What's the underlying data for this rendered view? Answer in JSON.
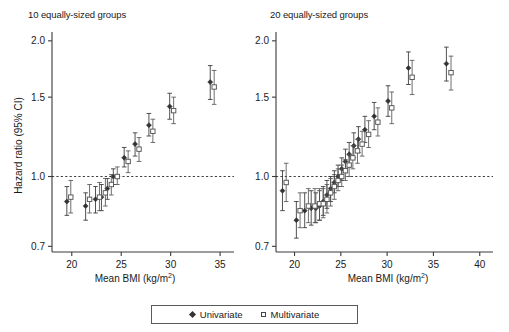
{
  "figure": {
    "legend": {
      "univariate_label": "Univariate",
      "multivariate_label": "Multivariate"
    },
    "axis": {
      "ylabel": "Hazard ratio (95% CI)",
      "xlabel_main": "Mean BMI (kg/m",
      "xlabel_unit": "2",
      "xlabel_close": ")"
    }
  },
  "chart_data": [
    {
      "type": "scatter",
      "panel": "left",
      "title": "10 equally-sized groups",
      "xlabel": "Mean BMI (kg/m2)",
      "ylabel": "Hazard ratio (95% CI)",
      "yscale": "log",
      "ylim": [
        0.68,
        2.05
      ],
      "yticks": [
        0.7,
        1.0,
        1.5,
        2.0
      ],
      "ytick_labels": [
        "0.7",
        "1.0",
        "1.5",
        "2.0"
      ],
      "xlim": [
        18.0,
        36.0
      ],
      "xticks": [
        20,
        25,
        30,
        35
      ],
      "xtick_labels": [
        "20",
        "25",
        "30",
        "35"
      ],
      "grid": false,
      "reference_line": 1.0,
      "legend_position": "bottom-center",
      "series": [
        {
          "name": "Univariate",
          "marker": "filled-diamond",
          "color": "#333333",
          "x": [
            19.5,
            21.4,
            22.4,
            23.0,
            23.6,
            24.2,
            25.3,
            26.4,
            27.8,
            29.9
          ],
          "y": [
            0.88,
            0.86,
            0.89,
            0.9,
            0.94,
            1.0,
            1.1,
            1.18,
            1.3,
            1.43
          ],
          "ci_low": [
            0.82,
            0.8,
            0.83,
            0.84,
            0.89,
            0.96,
            1.05,
            1.11,
            1.23,
            1.34
          ],
          "ci_high": [
            0.95,
            0.92,
            0.95,
            0.96,
            0.99,
            1.04,
            1.16,
            1.25,
            1.38,
            1.53
          ]
        },
        {
          "name": "Multivariate",
          "marker": "open-square",
          "color": "#555555",
          "x": [
            19.9,
            21.8,
            22.8,
            23.4,
            24.0,
            24.6,
            25.7,
            26.8,
            28.2,
            30.3
          ],
          "y": [
            0.9,
            0.89,
            0.9,
            0.92,
            0.96,
            1.0,
            1.08,
            1.15,
            1.26,
            1.4
          ],
          "ci_low": [
            0.83,
            0.83,
            0.84,
            0.86,
            0.91,
            0.96,
            1.02,
            1.08,
            1.19,
            1.31
          ],
          "ci_high": [
            0.98,
            0.96,
            0.97,
            0.99,
            1.01,
            1.05,
            1.14,
            1.22,
            1.34,
            1.5
          ]
        }
      ],
      "far_right_point": {
        "x_univariate": 34.0,
        "y_univariate": 1.62,
        "x_multivariate": 34.4,
        "y_multivariate": 1.58
      }
    },
    {
      "type": "scatter",
      "panel": "right",
      "title": "20 equally-sized groups",
      "xlabel": "Mean BMI (kg/m2)",
      "ylabel": "Hazard ratio (95% CI)",
      "yscale": "log",
      "ylim": [
        0.68,
        2.05
      ],
      "yticks": [
        0.7,
        1.0,
        1.5,
        2.0
      ],
      "ytick_labels": [
        "0.7",
        "1.0",
        "1.5",
        "2.0"
      ],
      "xlim": [
        18.0,
        41.0
      ],
      "xticks": [
        20,
        25,
        30,
        35,
        40
      ],
      "xtick_labels": [
        "20",
        "25",
        "30",
        "35",
        "40"
      ],
      "grid": false,
      "reference_line": 1.0,
      "legend_position": "bottom-center",
      "series": [
        {
          "name": "Univariate",
          "marker": "filled-diamond",
          "color": "#333333",
          "x": [
            18.7,
            20.2,
            21.1,
            21.8,
            22.3,
            22.7,
            23.1,
            23.5,
            23.9,
            24.3,
            24.7,
            25.1,
            25.5,
            25.9,
            26.4,
            26.9,
            27.6,
            28.6,
            30.1,
            32.3
          ],
          "y": [
            0.93,
            0.8,
            0.84,
            0.85,
            0.85,
            0.86,
            0.88,
            0.91,
            0.94,
            0.97,
            1.0,
            1.04,
            1.08,
            1.12,
            1.17,
            1.21,
            1.27,
            1.36,
            1.47,
            1.74
          ],
          "ci_low": [
            0.84,
            0.73,
            0.77,
            0.78,
            0.79,
            0.8,
            0.82,
            0.85,
            0.88,
            0.92,
            0.95,
            0.98,
            1.02,
            1.05,
            1.1,
            1.13,
            1.19,
            1.27,
            1.36,
            1.6
          ],
          "ci_high": [
            1.03,
            0.88,
            0.92,
            0.93,
            0.92,
            0.93,
            0.95,
            0.98,
            1.0,
            1.03,
            1.06,
            1.1,
            1.15,
            1.19,
            1.25,
            1.29,
            1.36,
            1.46,
            1.59,
            1.89
          ]
        },
        {
          "name": "Multivariate",
          "marker": "open-square",
          "color": "#555555",
          "x": [
            19.1,
            20.6,
            21.5,
            22.2,
            22.7,
            23.1,
            23.5,
            23.9,
            24.3,
            24.7,
            25.1,
            25.5,
            25.9,
            26.3,
            26.8,
            27.3,
            28.0,
            29.0,
            30.5,
            32.7
          ],
          "y": [
            0.97,
            0.84,
            0.86,
            0.86,
            0.87,
            0.87,
            0.89,
            0.92,
            0.95,
            0.98,
            1.0,
            1.03,
            1.06,
            1.1,
            1.14,
            1.18,
            1.24,
            1.32,
            1.42,
            1.66
          ],
          "ci_low": [
            0.88,
            0.77,
            0.79,
            0.79,
            0.8,
            0.81,
            0.83,
            0.86,
            0.89,
            0.93,
            0.95,
            0.98,
            1.0,
            1.04,
            1.07,
            1.11,
            1.16,
            1.23,
            1.31,
            1.52
          ],
          "ci_high": [
            1.07,
            0.92,
            0.94,
            0.94,
            0.94,
            0.94,
            0.96,
            0.99,
            1.01,
            1.04,
            1.06,
            1.09,
            1.12,
            1.17,
            1.21,
            1.26,
            1.33,
            1.42,
            1.54,
            1.81
          ]
        }
      ],
      "far_right_point": {
        "x_univariate": 36.4,
        "y_univariate": 1.78,
        "x_multivariate": 36.9,
        "y_multivariate": 1.7
      }
    }
  ]
}
